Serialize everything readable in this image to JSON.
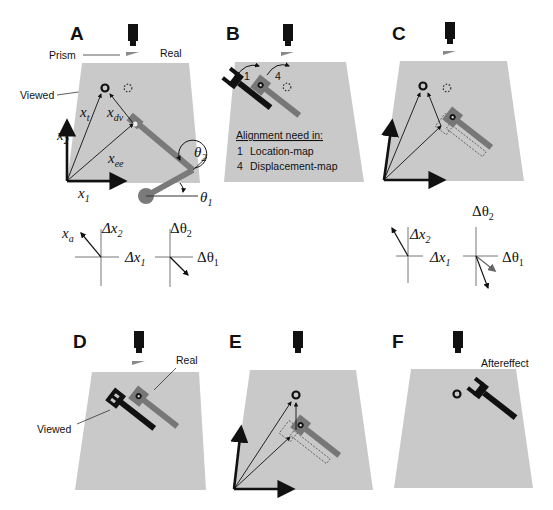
{
  "figure": {
    "panels": [
      {
        "id": "A",
        "label": "A"
      },
      {
        "id": "B",
        "label": "B"
      },
      {
        "id": "C",
        "label": "C"
      },
      {
        "id": "D",
        "label": "D"
      },
      {
        "id": "E",
        "label": "E"
      },
      {
        "id": "F",
        "label": "F"
      }
    ],
    "panelA": {
      "prism_label": "Prism",
      "real_label": "Real",
      "viewed_label": "Viewed",
      "vectors": {
        "xt": "x",
        "xt_sub": "t",
        "xdv": "x",
        "xdv_sub": "dv",
        "xee": "x",
        "xee_sub": "ee",
        "x1": "x",
        "x1_sub": "1",
        "x2": "x",
        "x2_sub": "2"
      },
      "angles": {
        "theta2": "θ",
        "theta2_sub": "2",
        "theta1": "θ",
        "theta1_sub": "1"
      },
      "inset_xa": "x",
      "inset_xa_sub": "a",
      "inset_dx2": "Δx",
      "inset_dx2_sub": "2",
      "inset_dx1": "Δx",
      "inset_dx1_sub": "1",
      "inset_dth2": "Δθ",
      "inset_dth2_sub": "2",
      "inset_dth1": "Δθ",
      "inset_dth1_sub": "1"
    },
    "panelB": {
      "step1": "1",
      "step4": "4",
      "legend_title": "Alignment need in:",
      "legend_items": [
        {
          "num": "1",
          "text": "Location-map"
        },
        {
          "num": "4",
          "text": "Displacement-map"
        }
      ]
    },
    "panelC": {
      "inset_dx2": "Δx",
      "inset_dx2_sub": "2",
      "inset_dx1": "Δx",
      "inset_dx1_sub": "1",
      "inset_dth2": "Δθ",
      "inset_dth2_sub": "2",
      "inset_dth1": "Δθ",
      "inset_dth1_sub": "1"
    },
    "panelD": {
      "real_label": "Real",
      "viewed_label": "Viewed"
    },
    "panelF": {
      "aftereffect_label": "Aftereffect"
    },
    "colors": {
      "table": "#c9c9c9",
      "arm_gray": "#7a7a7a",
      "dark": "#111111"
    }
  }
}
